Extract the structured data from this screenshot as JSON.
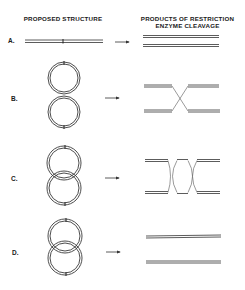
{
  "headers": {
    "left": "PROPOSED STRUCTURE",
    "right_line1": "PRODUCTS OF RESTRICTION",
    "right_line2": "ENZYME CLEAVAGE"
  },
  "rows": [
    {
      "label": "A.",
      "structure": "linear double-stranded DNA with single marked site",
      "products": "two separate linear duplexes"
    },
    {
      "label": "B.",
      "structure": "figure-eight: two circles joined at one crossover",
      "products": "two linear duplexes joined by single X crossover"
    },
    {
      "label": "C.",
      "structure": "two overlapping circles (catenane-like, two crossings)",
      "products": "two linear duplexes joined by two X crossovers"
    },
    {
      "label": "D.",
      "structure": "two interlocked circles (catenane)",
      "products": "two separate linear duplexes"
    }
  ],
  "colors": {
    "ink": "#3a3a3a",
    "background": "#ffffff"
  }
}
